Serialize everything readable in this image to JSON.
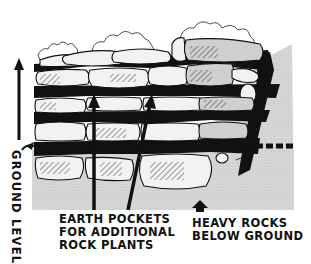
{
  "figure": {
    "type": "illustration",
    "colors": {
      "ink": "#111111",
      "stone_fill": "#f2f2f2",
      "stone_shadow_fill": "#cfcfcf",
      "ground_fill": "#d4d4d4",
      "background": "#ffffff"
    }
  },
  "labels": {
    "ground_level": "GROUND LEVEL",
    "earth_pockets": [
      "EARTH POCKETS",
      "FOR ADDITIONAL",
      "ROCK PLANTS"
    ],
    "heavy_rocks": [
      "HEAVY ROCKS",
      "BELOW GROUND"
    ]
  },
  "annotations": {
    "ground_level_marker": "dashed line",
    "arrows": [
      {
        "name": "ground-level-arrow",
        "direction": "up"
      },
      {
        "name": "earth-pocket-arrow-1",
        "direction": "up"
      },
      {
        "name": "earth-pocket-arrow-2",
        "direction": "up"
      },
      {
        "name": "heavy-rocks-arrow",
        "direction": "up"
      }
    ]
  }
}
